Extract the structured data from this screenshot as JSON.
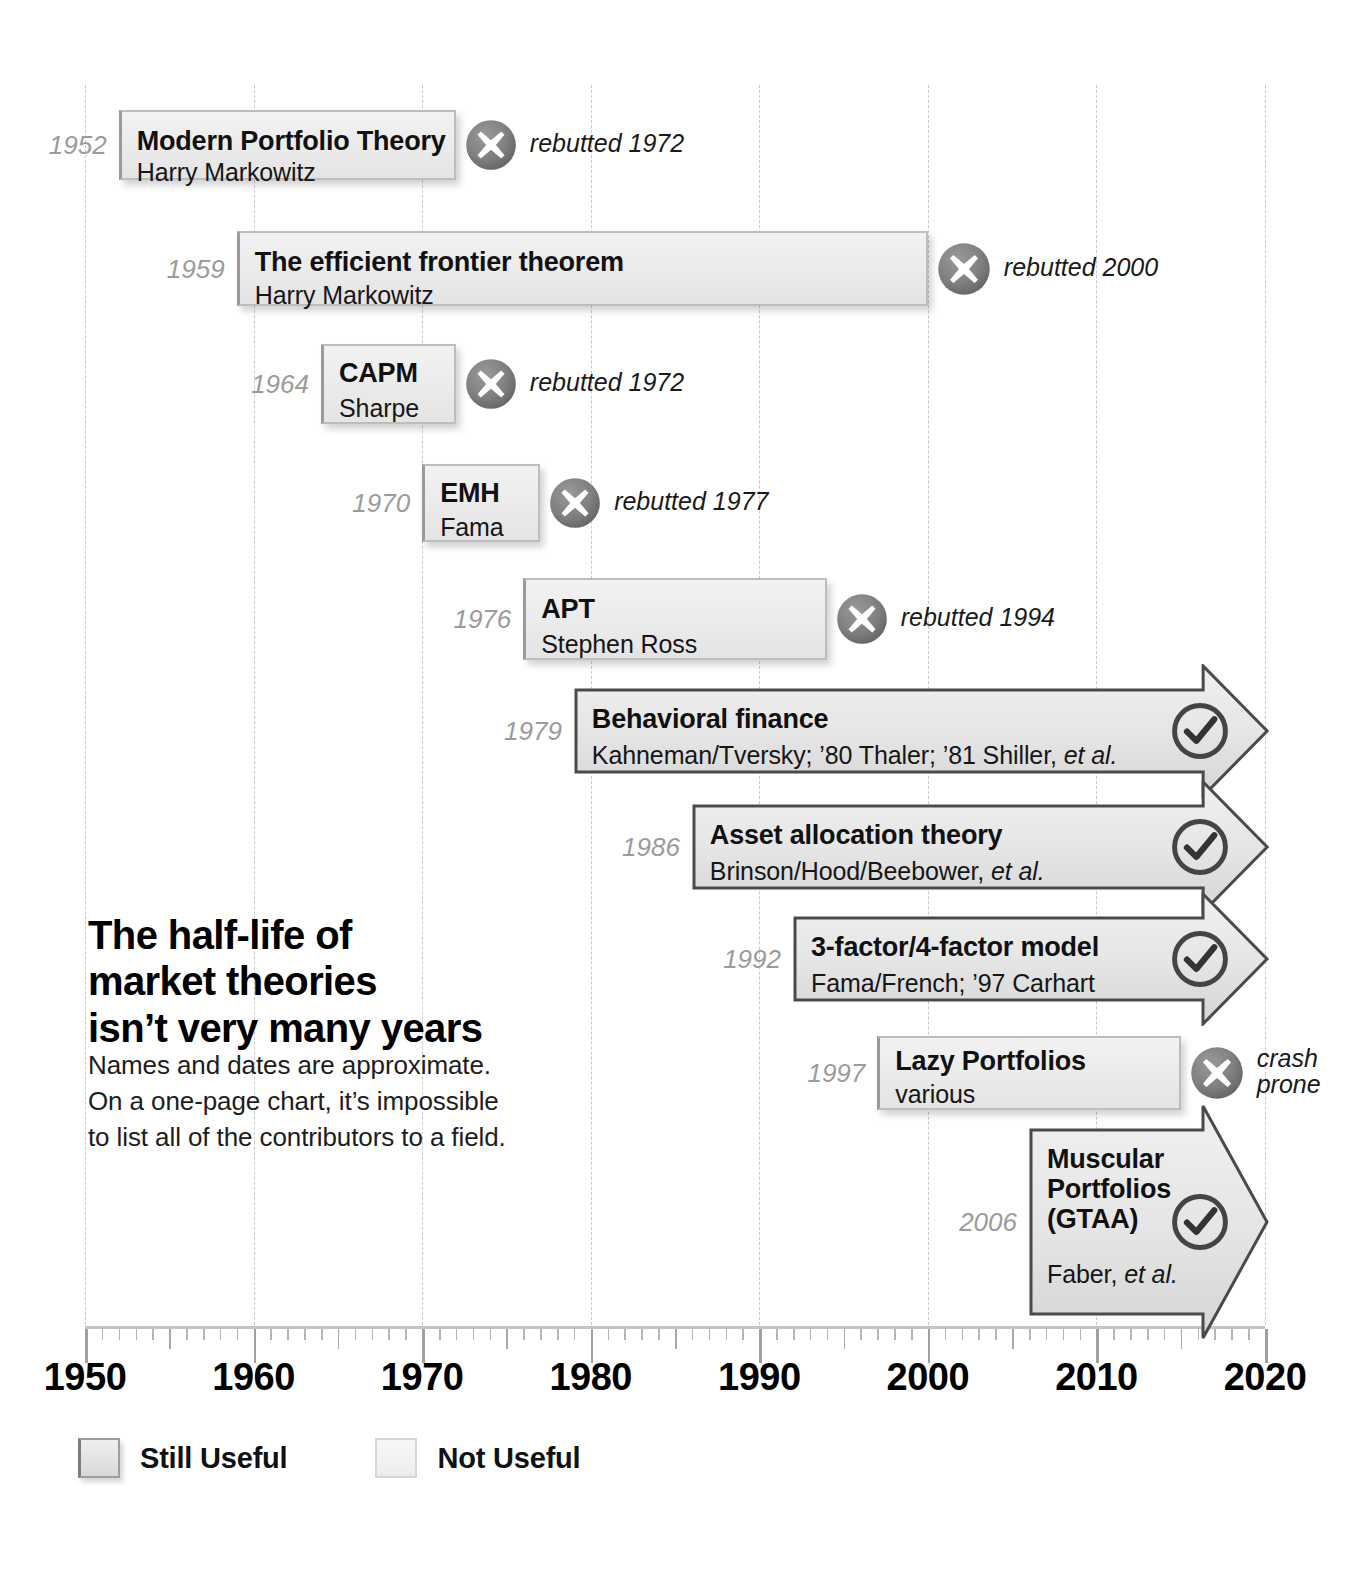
{
  "headline": "The half-life of\nmarket theories\nisn’t very many years",
  "blurb": "Names and dates are approximate.\nOn a one-page chart, it’s impossible\nto list all of the contributors to a field.",
  "legend": {
    "still_useful": "Still Useful",
    "not_useful": "Not Useful"
  },
  "chart_data": {
    "type": "bar",
    "subtitle": "Names and dates are approximate. On a one-page chart, it’s impossible to list all of the contributors to a field.",
    "xlabel": "",
    "ylabel": "",
    "xlim": [
      1950,
      2020
    ],
    "axis_ticks": [
      "1950",
      "1960",
      "1970",
      "1980",
      "1990",
      "2000",
      "2010",
      "2020"
    ],
    "grid": true,
    "legend_position": "bottom-left",
    "legend_entries": [
      "Still Useful",
      "Not Useful"
    ],
    "categories": [
      "Modern Portfolio Theory",
      "The efficient frontier theorem",
      "CAPM",
      "EMH",
      "APT",
      "Behavioral finance",
      "Asset allocation theory",
      "3-factor/4-factor model",
      "Lazy Portfolios",
      "Muscular Portfolios (GTAA)"
    ],
    "bars": [
      {
        "label": "Modern Portfolio Theory",
        "authors": "Harry Markowitz",
        "year_label": "1952",
        "start": 1952,
        "end": 1972,
        "status": "rebutted",
        "status_icon": "x-circle-icon",
        "status_label": "rebutted 1972",
        "useful": false
      },
      {
        "label": "The efficient frontier theorem",
        "authors": "Harry Markowitz",
        "year_label": "1959",
        "start": 1959,
        "end": 2000,
        "status": "rebutted",
        "status_icon": "x-circle-icon",
        "status_label": "rebutted 2000",
        "useful": false
      },
      {
        "label": "CAPM",
        "authors": "Sharpe",
        "year_label": "1964",
        "start": 1964,
        "end": 1972,
        "status": "rebutted",
        "status_icon": "x-circle-icon",
        "status_label": "rebutted 1972",
        "useful": false
      },
      {
        "label": "EMH",
        "authors": "Fama",
        "year_label": "1970",
        "start": 1970,
        "end": 1977,
        "status": "rebutted",
        "status_icon": "x-circle-icon",
        "status_label": "rebutted 1977",
        "useful": false
      },
      {
        "label": "APT",
        "authors": "Stephen Ross",
        "year_label": "1976",
        "start": 1976,
        "end": 1994,
        "status": "rebutted",
        "status_icon": "x-circle-icon",
        "status_label": "rebutted 1994",
        "useful": false
      },
      {
        "label": "Behavioral finance",
        "authors": "Kahneman/Tversky; ’80 Thaler; ’81 Shiller, et al.",
        "year_label": "1979",
        "start": 1979,
        "end": 2020,
        "status": "still-useful",
        "status_icon": "check-circle-icon",
        "status_label": "",
        "useful": true
      },
      {
        "label": "Asset allocation theory",
        "authors": "Brinson/Hood/Beebower, et al.",
        "year_label": "1986",
        "start": 1986,
        "end": 2020,
        "status": "still-useful",
        "status_icon": "check-circle-icon",
        "status_label": "",
        "useful": true
      },
      {
        "label": "3-factor/4-factor model",
        "authors": "Fama/French; ’97 Carhart",
        "year_label": "1992",
        "start": 1992,
        "end": 2020,
        "status": "still-useful",
        "status_icon": "check-circle-icon",
        "status_label": "",
        "useful": true
      },
      {
        "label": "Lazy Portfolios",
        "authors": "various",
        "year_label": "1997",
        "start": 1997,
        "end": 2015,
        "status": "crash-prone",
        "status_icon": "x-circle-icon",
        "status_label": "crash\nprone",
        "useful": false
      },
      {
        "label": "Muscular Portfolios (GTAA)",
        "authors": "Faber, et al.",
        "year_label": "2006",
        "start": 2006,
        "end": 2020,
        "status": "still-useful",
        "status_icon": "check-circle-icon",
        "status_label": "",
        "useful": true
      }
    ]
  }
}
